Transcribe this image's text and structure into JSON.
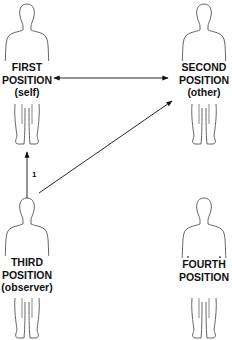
{
  "diagram": {
    "type": "perceptual-positions",
    "line_color": "#111111",
    "figure_stroke": "#555555",
    "positions": [
      {
        "id": "first",
        "title": "FIRST",
        "subtitle": "POSITION",
        "role": "(self)",
        "cx": 27,
        "top": 4
      },
      {
        "id": "second",
        "title": "SECOND",
        "subtitle": "POSITION",
        "role": "(other)",
        "cx": 204,
        "top": 4
      },
      {
        "id": "third",
        "title": "THIRD",
        "subtitle": "POSITION",
        "role": "(observer)",
        "cx": 27,
        "top": 198
      },
      {
        "id": "fourth",
        "title": "FOURTH",
        "subtitle": "POSITION",
        "role": "",
        "cx": 204,
        "top": 198
      }
    ],
    "arrows": [
      {
        "from": "first",
        "to": "second",
        "style": "double-headed",
        "label": ""
      },
      {
        "from": "third",
        "to": "first",
        "style": "single-headed",
        "label": "1"
      },
      {
        "from": "third",
        "to": "second",
        "style": "single-headed",
        "label": ""
      }
    ],
    "arrow_label_1": "1"
  }
}
